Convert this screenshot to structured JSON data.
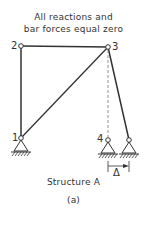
{
  "annotation": {
    "line1": "All reactions and",
    "line2": "bar forces equal zero"
  },
  "nodes": {
    "n1": "1",
    "n2": "2",
    "n3": "3",
    "n4": "4"
  },
  "displacement_label": "Δ",
  "title": "Structure A",
  "subtitle": "(a)",
  "colors": {
    "line": "#333333",
    "dashed": "#777777"
  }
}
